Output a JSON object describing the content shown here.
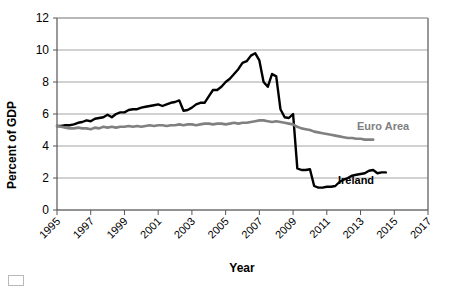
{
  "chart_data": {
    "type": "line",
    "title": "",
    "xlabel": "Year",
    "ylabel": "Percent of GDP",
    "xlim": [
      1995,
      2017
    ],
    "ylim": [
      0,
      12
    ],
    "grid": true,
    "legend_position": "inline-labels",
    "y_ticks": [
      "12",
      "10",
      "8",
      "6",
      "4",
      "2",
      "0"
    ],
    "y_tick_values": [
      12,
      10,
      8,
      6,
      4,
      2,
      0
    ],
    "x_ticks": [
      "1995",
      "1997",
      "1999",
      "2001",
      "2003",
      "2005",
      "2007",
      "2009",
      "2011",
      "2013",
      "2015",
      "2017"
    ],
    "x_tick_values": [
      1995,
      1997,
      1999,
      2001,
      2003,
      2005,
      2007,
      2009,
      2011,
      2013,
      2015,
      2017
    ],
    "series": [
      {
        "name": "Ireland",
        "color": "#000000",
        "label_text": "Ireland",
        "x": [
          1995.0,
          1995.25,
          1995.5,
          1995.75,
          1996.0,
          1996.25,
          1996.5,
          1996.75,
          1997.0,
          1997.25,
          1997.5,
          1997.75,
          1998.0,
          1998.25,
          1998.5,
          1998.75,
          1999.0,
          1999.25,
          1999.5,
          1999.75,
          2000.0,
          2000.25,
          2000.5,
          2000.75,
          2001.0,
          2001.25,
          2001.5,
          2001.75,
          2002.0,
          2002.25,
          2002.5,
          2002.75,
          2003.0,
          2003.25,
          2003.5,
          2003.75,
          2004.0,
          2004.25,
          2004.5,
          2004.75,
          2005.0,
          2005.25,
          2005.5,
          2005.75,
          2006.0,
          2006.25,
          2006.5,
          2006.75,
          2007.0,
          2007.25,
          2007.5,
          2007.75,
          2008.0,
          2008.25,
          2008.5,
          2008.75,
          2009.0,
          2009.25,
          2009.5,
          2009.75,
          2010.0,
          2010.25,
          2010.5,
          2010.75,
          2011.0,
          2011.25,
          2011.5,
          2011.75,
          2012.0,
          2012.25,
          2012.5,
          2012.75,
          2013.0,
          2013.25,
          2013.5,
          2013.75,
          2014.0,
          2014.25,
          2014.5
        ],
        "y": [
          5.25,
          5.25,
          5.3,
          5.3,
          5.35,
          5.45,
          5.5,
          5.6,
          5.55,
          5.7,
          5.75,
          5.8,
          5.95,
          5.8,
          6.0,
          6.1,
          6.1,
          6.25,
          6.3,
          6.3,
          6.4,
          6.45,
          6.5,
          6.55,
          6.6,
          6.5,
          6.6,
          6.7,
          6.75,
          6.85,
          6.2,
          6.25,
          6.4,
          6.6,
          6.7,
          6.7,
          7.1,
          7.5,
          7.5,
          7.7,
          8.0,
          8.2,
          8.5,
          8.8,
          9.2,
          9.3,
          9.65,
          9.8,
          9.35,
          8.0,
          7.7,
          8.5,
          8.35,
          6.3,
          5.8,
          5.75,
          6.0,
          2.6,
          2.5,
          2.5,
          2.55,
          1.5,
          1.4,
          1.4,
          1.45,
          1.45,
          1.5,
          1.75,
          1.9,
          2.0,
          2.15,
          2.2,
          2.25,
          2.3,
          2.45,
          2.5,
          2.3,
          2.35,
          2.35
        ]
      },
      {
        "name": "Euro Area",
        "color": "#808080",
        "label_text": "Euro Area",
        "x": [
          1995.0,
          1995.25,
          1995.5,
          1995.75,
          1996.0,
          1996.25,
          1996.5,
          1996.75,
          1997.0,
          1997.25,
          1997.5,
          1997.75,
          1998.0,
          1998.25,
          1998.5,
          1998.75,
          1999.0,
          1999.25,
          1999.5,
          1999.75,
          2000.0,
          2000.25,
          2000.5,
          2000.75,
          2001.0,
          2001.25,
          2001.5,
          2001.75,
          2002.0,
          2002.25,
          2002.5,
          2002.75,
          2003.0,
          2003.25,
          2003.5,
          2003.75,
          2004.0,
          2004.25,
          2004.5,
          2004.75,
          2005.0,
          2005.25,
          2005.5,
          2005.75,
          2006.0,
          2006.25,
          2006.5,
          2006.75,
          2007.0,
          2007.25,
          2007.5,
          2007.75,
          2008.0,
          2008.25,
          2008.5,
          2008.75,
          2009.0,
          2009.25,
          2009.5,
          2009.75,
          2010.0,
          2010.25,
          2010.5,
          2010.75,
          2011.0,
          2011.25,
          2011.5,
          2011.75,
          2012.0,
          2012.25,
          2012.5,
          2012.75,
          2013.0,
          2013.25,
          2013.5,
          2013.75
        ],
        "y": [
          5.25,
          5.2,
          5.15,
          5.1,
          5.1,
          5.15,
          5.1,
          5.1,
          5.05,
          5.15,
          5.1,
          5.2,
          5.15,
          5.2,
          5.15,
          5.2,
          5.2,
          5.25,
          5.2,
          5.25,
          5.2,
          5.25,
          5.3,
          5.25,
          5.3,
          5.3,
          5.25,
          5.3,
          5.3,
          5.35,
          5.3,
          5.35,
          5.35,
          5.3,
          5.35,
          5.4,
          5.4,
          5.35,
          5.4,
          5.4,
          5.35,
          5.4,
          5.45,
          5.4,
          5.45,
          5.45,
          5.5,
          5.55,
          5.6,
          5.6,
          5.55,
          5.5,
          5.55,
          5.5,
          5.45,
          5.4,
          5.35,
          5.2,
          5.1,
          5.05,
          5.0,
          4.9,
          4.85,
          4.8,
          4.75,
          4.7,
          4.65,
          4.6,
          4.55,
          4.5,
          4.5,
          4.45,
          4.45,
          4.4,
          4.4,
          4.4
        ]
      }
    ]
  },
  "axis": {
    "x_title": "Year",
    "y_title": "Percent of GDP"
  }
}
